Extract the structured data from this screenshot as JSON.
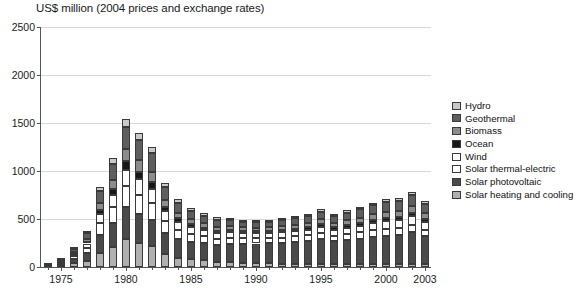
{
  "chart_data": {
    "type": "bar",
    "title": "US$ million (2004 prices and exchange rates)",
    "subtitle": "",
    "xlabel": "",
    "ylabel": "",
    "stacked": true,
    "grid": true,
    "legend_position": "right",
    "ylim": [
      0,
      2500
    ],
    "yticks": [
      0,
      500,
      1000,
      1500,
      2000,
      2500
    ],
    "ytick_labels": [
      "0",
      "500",
      "1000",
      "1500",
      "2000",
      "2500"
    ],
    "xtick_labels": [
      "1975",
      "1980",
      "1985",
      "1990",
      "1995",
      "2000",
      "2003"
    ],
    "categories": [
      "1974",
      "1975",
      "1976",
      "1977",
      "1978",
      "1979",
      "1980",
      "1981",
      "1982",
      "1983",
      "1984",
      "1985",
      "1986",
      "1987",
      "1988",
      "1989",
      "1990",
      "1991",
      "1992",
      "1993",
      "1994",
      "1995",
      "1996",
      "1997",
      "1998",
      "1999",
      "2000",
      "2001",
      "2002",
      "2003"
    ],
    "series": [
      {
        "name": "Solar heating and cooling",
        "color": "#b0b0b0",
        "values": [
          8,
          20,
          38,
          60,
          150,
          210,
          290,
          255,
          215,
          140,
          95,
          80,
          70,
          55,
          48,
          42,
          40,
          38,
          36,
          35,
          34,
          33,
          32,
          30,
          30,
          29,
          28,
          28,
          30,
          28
        ]
      },
      {
        "name": "Solar photovoltaic",
        "color": "#4a4a4a",
        "values": [
          5,
          18,
          42,
          85,
          185,
          250,
          335,
          300,
          275,
          215,
          195,
          185,
          180,
          175,
          195,
          200,
          205,
          210,
          215,
          225,
          235,
          255,
          235,
          250,
          265,
          285,
          300,
          305,
          330,
          290
        ]
      },
      {
        "name": "Solar thermal-electric",
        "color": "#ffffff",
        "values": [
          3,
          10,
          30,
          55,
          120,
          160,
          215,
          195,
          175,
          120,
          95,
          80,
          70,
          65,
          62,
          58,
          55,
          55,
          55,
          58,
          60,
          65,
          60,
          62,
          65,
          68,
          70,
          72,
          78,
          68
        ]
      },
      {
        "name": "Wind",
        "color": "#fcfcfc",
        "values": [
          2,
          8,
          22,
          45,
          95,
          130,
          175,
          165,
          150,
          105,
          85,
          72,
          62,
          58,
          55,
          52,
          50,
          52,
          55,
          58,
          60,
          68,
          62,
          68,
          72,
          78,
          82,
          85,
          92,
          82
        ]
      },
      {
        "name": "Ocean",
        "color": "#171717",
        "values": [
          1,
          4,
          10,
          20,
          45,
          62,
          85,
          78,
          70,
          48,
          38,
          32,
          28,
          25,
          24,
          22,
          20,
          20,
          22,
          23,
          24,
          26,
          24,
          26,
          28,
          30,
          32,
          32,
          36,
          30
        ]
      },
      {
        "name": "Biomass",
        "color": "#8c8c8c",
        "values": [
          2,
          6,
          16,
          32,
          70,
          95,
          130,
          120,
          108,
          75,
          58,
          50,
          45,
          42,
          40,
          38,
          36,
          38,
          40,
          42,
          45,
          50,
          46,
          50,
          55,
          60,
          65,
          66,
          72,
          62
        ]
      },
      {
        "name": "Geothermal",
        "color": "#5e5e5e",
        "values": [
          3,
          12,
          32,
          58,
          125,
          170,
          230,
          210,
          190,
          130,
          105,
          88,
          78,
          72,
          68,
          62,
          58,
          60,
          62,
          66,
          70,
          78,
          72,
          78,
          85,
          92,
          98,
          100,
          110,
          95
        ]
      },
      {
        "name": "Hydro",
        "color": "#c8c8c8",
        "values": [
          1,
          4,
          10,
          20,
          42,
          58,
          80,
          72,
          65,
          45,
          35,
          30,
          26,
          24,
          22,
          20,
          19,
          20,
          21,
          22,
          24,
          26,
          24,
          26,
          28,
          30,
          32,
          33,
          36,
          30
        ]
      }
    ]
  },
  "legend": {
    "items": [
      {
        "label": "Hydro",
        "color": "#c8c8c8"
      },
      {
        "label": "Geothermal",
        "color": "#5e5e5e"
      },
      {
        "label": "Biomass",
        "color": "#8c8c8c"
      },
      {
        "label": "Ocean",
        "color": "#171717"
      },
      {
        "label": "Wind",
        "color": "#fcfcfc"
      },
      {
        "label": "Solar thermal-electric",
        "color": "#ffffff"
      },
      {
        "label": "Solar photovoltaic",
        "color": "#4a4a4a"
      },
      {
        "label": "Solar heating and cooling",
        "color": "#b0b0b0"
      }
    ]
  }
}
